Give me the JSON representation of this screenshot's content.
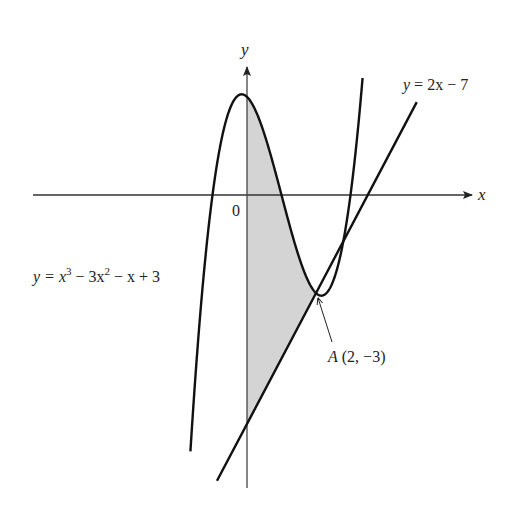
{
  "chart_data": {
    "type": "line",
    "title": "",
    "axes": {
      "x_label": "x",
      "y_label": "y",
      "origin_label": "0",
      "xlim": [
        -1.55,
        6.5
      ],
      "ylim": [
        -8.9,
        4.7
      ],
      "grid": false
    },
    "series": [
      {
        "name": "cubic",
        "label": "y = x³ − 3x² − x + 3",
        "equation": "x^3 - 3x^2 - x + 3",
        "coefficients": [
          1,
          -3,
          -1,
          3
        ],
        "domain": [
          -1.64,
          3.35
        ]
      },
      {
        "name": "line",
        "label": "y = 2x − 7",
        "equation": "2x - 7",
        "slope": 2,
        "intercept": -7,
        "domain": [
          -0.87,
          4.92
        ]
      }
    ],
    "shaded_region": {
      "description": "region bounded by y-axis, curve and line",
      "x_from": 0,
      "x_to": 2,
      "upper": "cubic",
      "lower": "line",
      "color": "#d4d4d4"
    },
    "annotations": [
      {
        "name": "point-A",
        "label": "A (2, −3)",
        "x": 2,
        "y": -3
      }
    ]
  },
  "labels": {
    "x_axis": "x",
    "y_axis": "y",
    "origin": "0",
    "line_eq": "y = 2x − 7",
    "cubic_eq_prefix": "y = x",
    "cubic_sup1": "3",
    "cubic_mid": " − 3x",
    "cubic_sup2": "2",
    "cubic_tail": " − x + 3",
    "point_A_name": "A",
    "point_A_coords": " (2, −3)"
  },
  "colors": {
    "curve": "#111111",
    "axis": "#333333",
    "shade": "#d4d4d4",
    "background": "#ffffff"
  }
}
